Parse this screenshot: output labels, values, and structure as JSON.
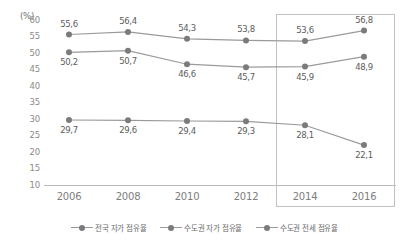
{
  "chart_data": {
    "type": "line",
    "title": "",
    "subtitle": "",
    "xlabel": "",
    "ylabel": "",
    "unit_label": "(%)",
    "categories": [
      "2006",
      "2008",
      "2010",
      "2012",
      "2014",
      "2016"
    ],
    "ylim": [
      10,
      60
    ],
    "ytick_step": 5,
    "yticks": [
      "60",
      "55",
      "50",
      "45",
      "40",
      "35",
      "30",
      "25",
      "20",
      "15",
      "10"
    ],
    "grid": false,
    "legend_position": "bottom",
    "series": [
      {
        "name": "전국 자가 점유율",
        "values": [
          55.6,
          56.4,
          54.3,
          53.8,
          53.6,
          56.8
        ],
        "labels": [
          "55,6",
          "56,4",
          "54,3",
          "53,8",
          "53,6",
          "56,8"
        ],
        "label_side": [
          "above",
          "above",
          "above",
          "above",
          "above",
          "above"
        ],
        "color": "#9a9a9a"
      },
      {
        "name": "수도권 자가 점유율",
        "values": [
          50.2,
          50.7,
          46.6,
          45.7,
          45.9,
          48.9
        ],
        "labels": [
          "50,2",
          "50,7",
          "46,6",
          "45,7",
          "45,9",
          "48,9"
        ],
        "label_side": [
          "below",
          "below",
          "below",
          "below",
          "below",
          "below"
        ],
        "color": "#9a9a9a"
      },
      {
        "name": "수도권 전세 점유율",
        "values": [
          29.7,
          29.6,
          29.4,
          29.3,
          28.1,
          22.1
        ],
        "labels": [
          "29,7",
          "29,6",
          "29,4",
          "29,3",
          "28,1",
          "22,1"
        ],
        "label_side": [
          "below",
          "below",
          "below",
          "below",
          "below",
          "below"
        ],
        "color": "#9a9a9a"
      }
    ],
    "annotations": [
      {
        "type": "highlight-rect",
        "covers_categories": [
          "2014",
          "2016"
        ],
        "color": "#c2c2c2"
      }
    ]
  },
  "legend": {
    "items": [
      {
        "label": "전국 자가 점유율"
      },
      {
        "label": "수도권 자가 점유율"
      },
      {
        "label": "수도권 전세 점유율"
      }
    ]
  }
}
